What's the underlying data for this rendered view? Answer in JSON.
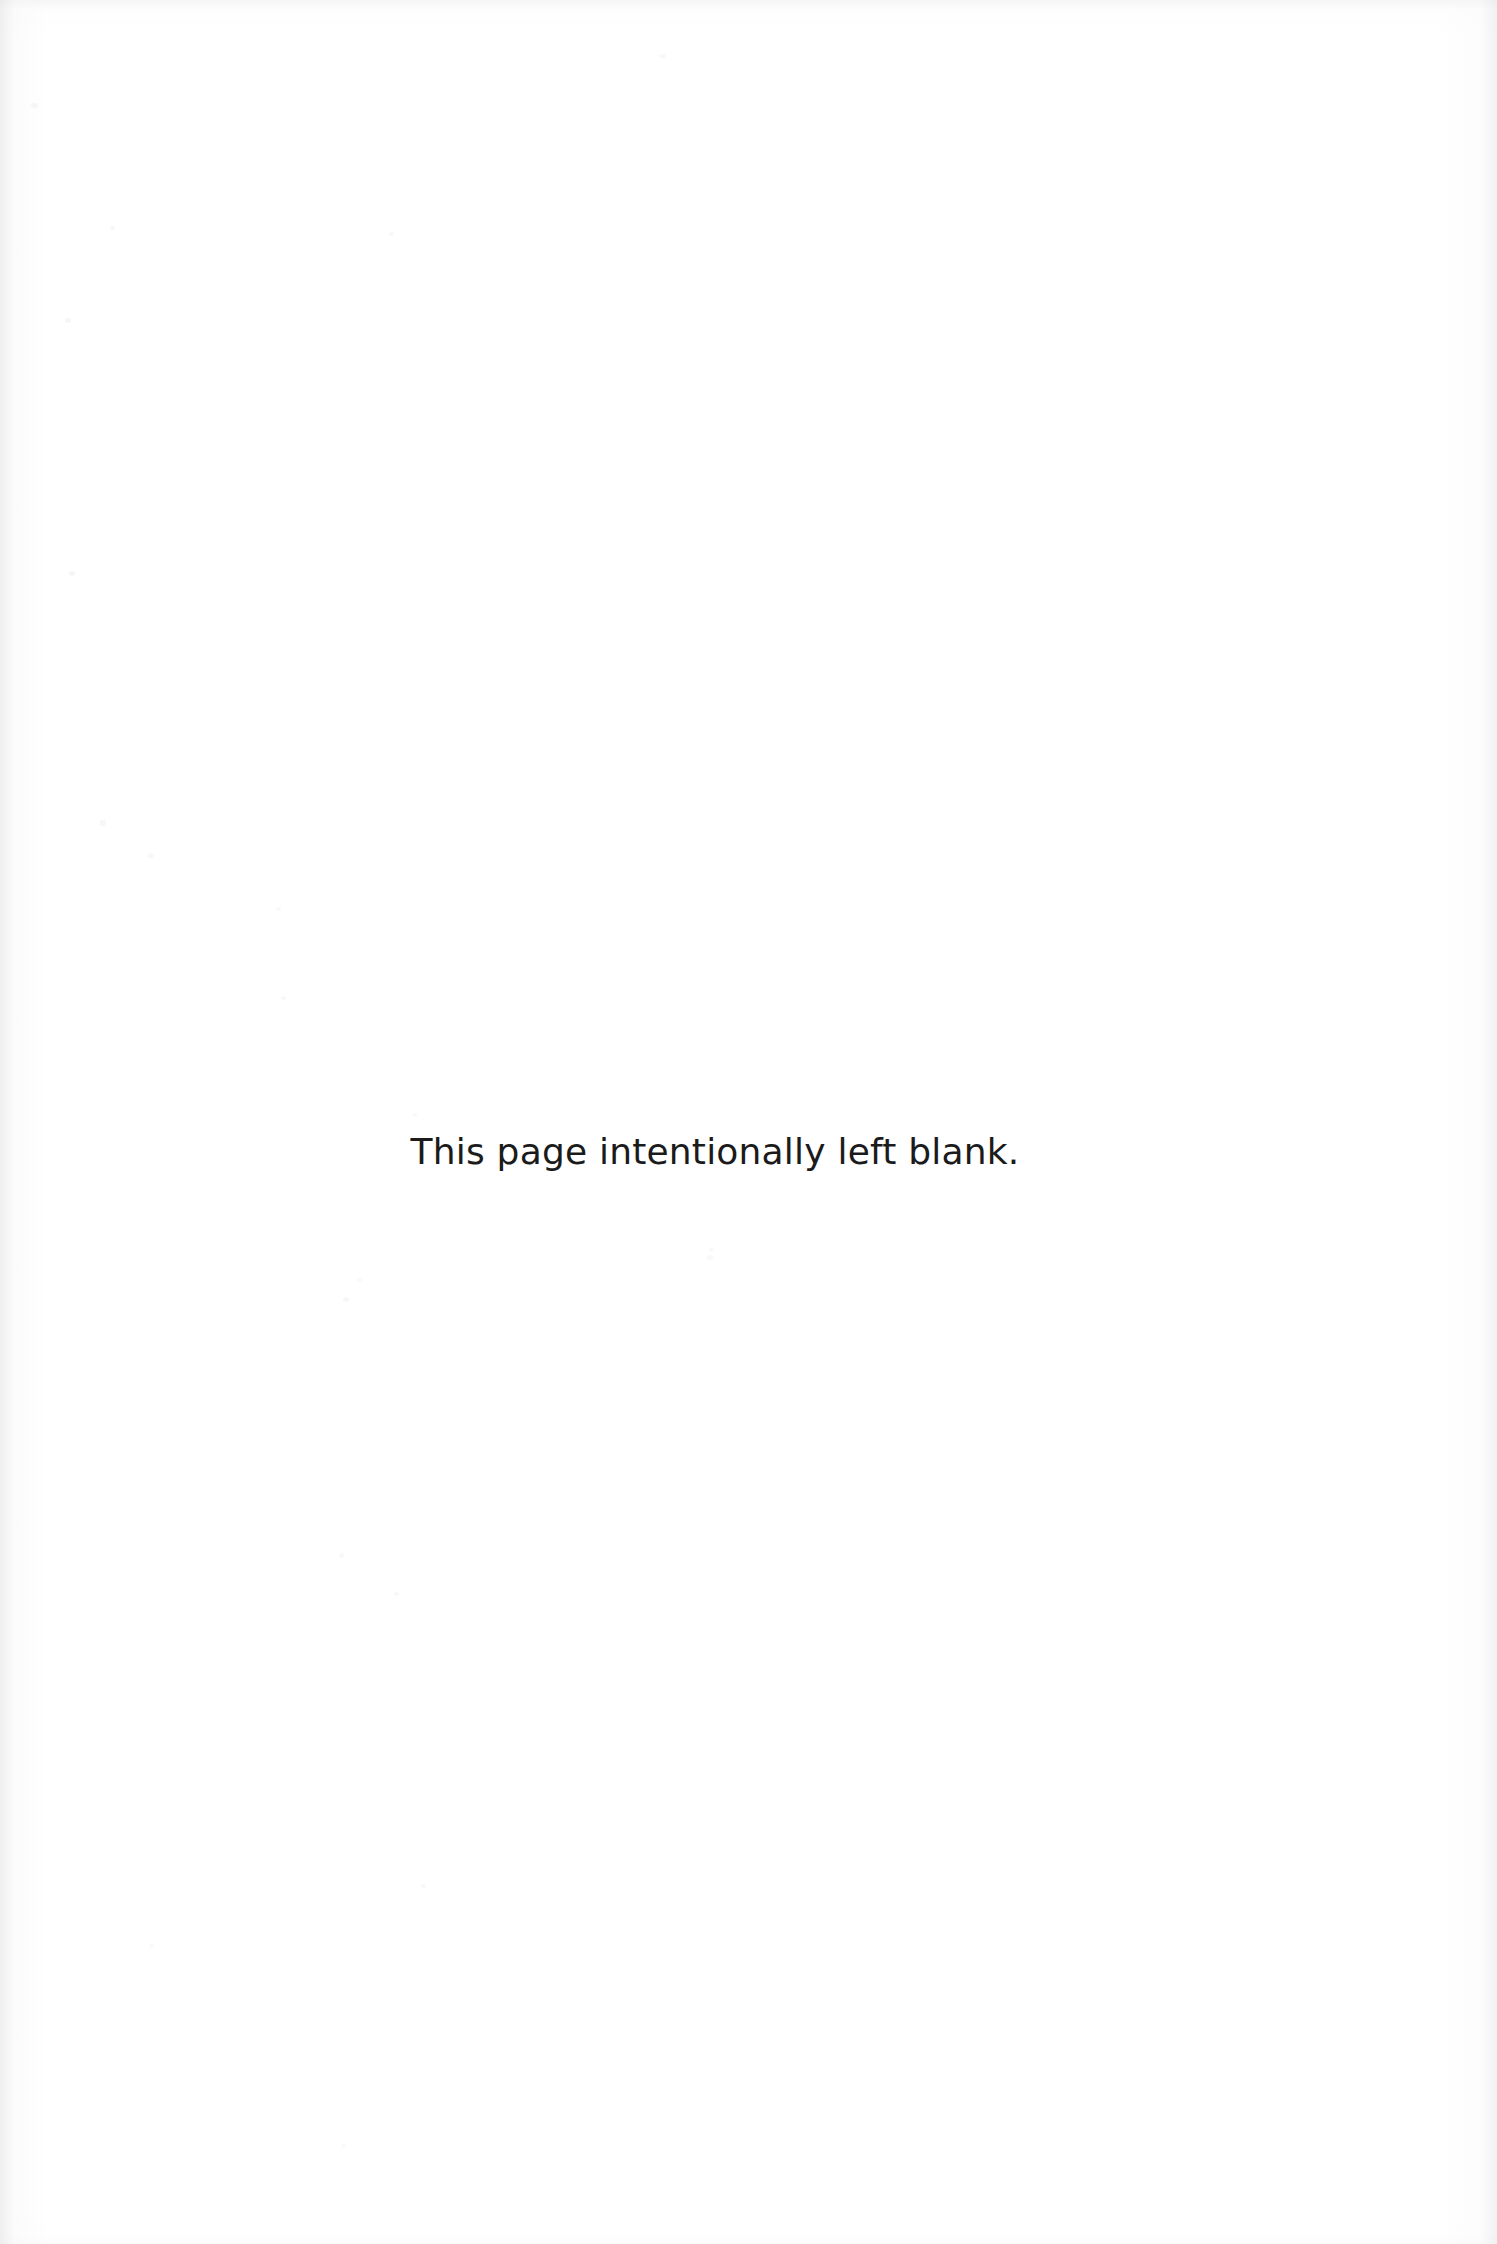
{
  "document": {
    "page_type": "intentionally-blank-page",
    "background_color": "#ffffff",
    "text_color": "#1b1b1b",
    "body": {
      "notice": "This page intentionally left blank."
    }
  }
}
